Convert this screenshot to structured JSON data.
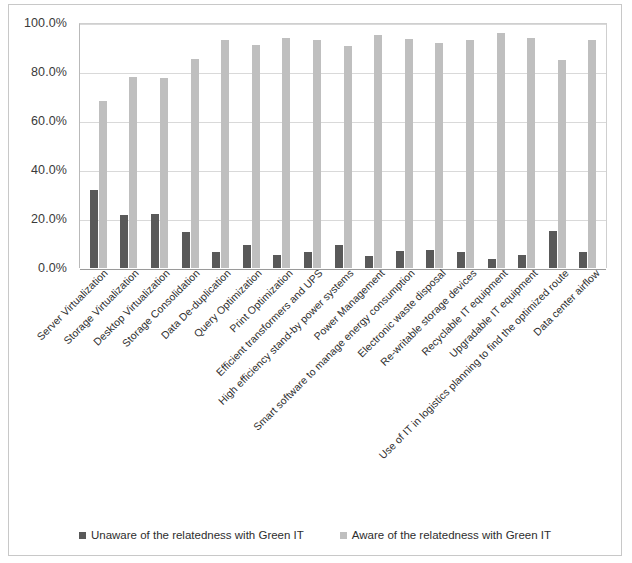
{
  "chart_data": {
    "type": "bar",
    "title": "",
    "subtitle": "",
    "xlabel": "",
    "ylabel": "",
    "ylim": [
      0,
      100
    ],
    "ytick_labels": [
      "100.0%",
      "80.0%",
      "60.0%",
      "40.0%",
      "20.0%",
      "0.0%"
    ],
    "ytick_values": [
      100,
      80,
      60,
      40,
      20,
      0
    ],
    "grid": true,
    "legend_position": "bottom",
    "categories": [
      "Server Virtualization",
      "Storage Virtualization",
      "Desktop Virtualization",
      "Storage Consolidation",
      "Data De-duplication",
      "Query Optimization",
      "Print Optimization",
      "Efficient transformers and UPS",
      "High efficiency stand-by power systems",
      "Power Management",
      "Smart software to manage energy consumption",
      "Electronic waste disposal",
      "Re-writable storage devices",
      "Recyclable IT equipment",
      "Upgradable IT equipment",
      "Use of IT in logistics planning to find the optimized route",
      "Data center airflow"
    ],
    "series": [
      {
        "name": "Unaware of the relatedness with Green IT",
        "color": "#595959",
        "values": [
          32.0,
          21.5,
          22.0,
          14.5,
          6.5,
          9.5,
          5.5,
          6.5,
          9.5,
          5.0,
          7.0,
          7.5,
          6.5,
          3.5,
          5.5,
          15.0,
          6.5
        ]
      },
      {
        "name": "Aware of the relatedness with Green IT",
        "color": "#bfbfbf",
        "values": [
          68.0,
          78.0,
          77.5,
          85.5,
          93.0,
          91.0,
          94.0,
          93.0,
          90.5,
          95.0,
          93.5,
          92.0,
          93.0,
          96.0,
          94.0,
          85.0,
          93.0
        ]
      }
    ]
  },
  "legend": {
    "items": [
      {
        "label": "Unaware of the relatedness with Green IT",
        "swatch": "unaware"
      },
      {
        "label": "Aware of the relatedness with Green IT",
        "swatch": "aware"
      }
    ]
  }
}
